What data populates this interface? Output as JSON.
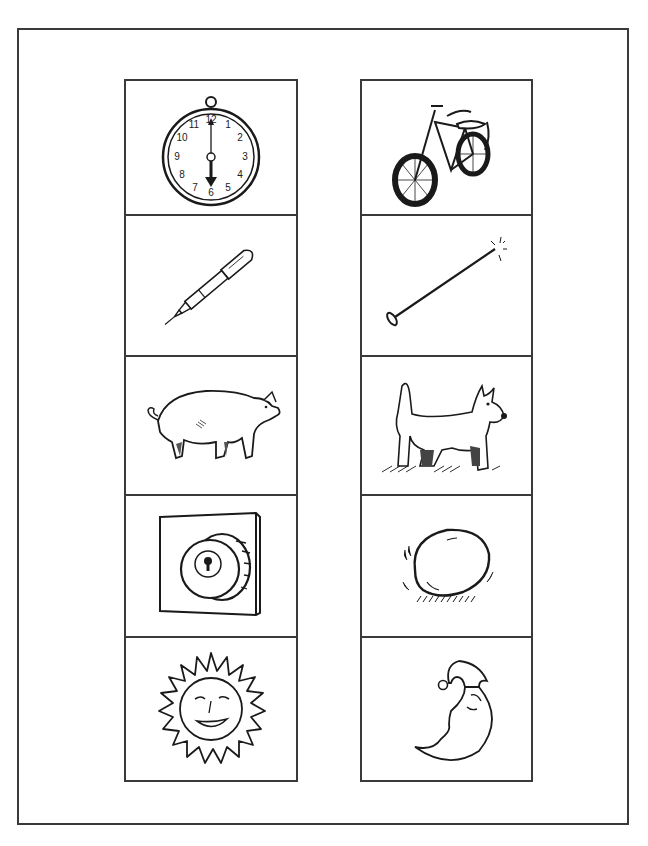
{
  "worksheet": {
    "left_column": [
      {
        "item": "clock",
        "icon": "clock-icon",
        "clock": {
          "numbers": [
            "12",
            "1",
            "2",
            "3",
            "4",
            "5",
            "6",
            "7",
            "8",
            "9",
            "10",
            "11"
          ],
          "time": "6:00"
        }
      },
      {
        "item": "pen",
        "icon": "pen-icon"
      },
      {
        "item": "pig",
        "icon": "pig-icon"
      },
      {
        "item": "lock",
        "icon": "lock-icon"
      },
      {
        "item": "sun",
        "icon": "sun-icon"
      }
    ],
    "right_column": [
      {
        "item": "bike",
        "icon": "bike-icon"
      },
      {
        "item": "pin",
        "icon": "pin-icon"
      },
      {
        "item": "dog",
        "icon": "dog-icon"
      },
      {
        "item": "egg",
        "icon": "egg-icon"
      },
      {
        "item": "moon",
        "icon": "moon-icon"
      }
    ]
  },
  "colors": {
    "line": "#1a1a1a",
    "frame": "#3a3a3a",
    "background": "#ffffff"
  }
}
